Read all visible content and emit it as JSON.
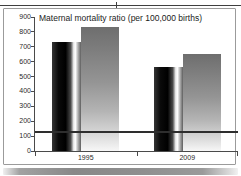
{
  "chart_data": {
    "type": "bar",
    "title": "Maternal mortality ratio (per 100,000 births)",
    "categories": [
      "1995",
      "2009"
    ],
    "series": [
      {
        "name": "dark-glossy-bars",
        "values": [
          730,
          565
        ]
      },
      {
        "name": "gray-gradient-bars",
        "values": [
          830,
          650
        ]
      }
    ],
    "reference_line": {
      "value": 130
    },
    "ylim": [
      0,
      900
    ],
    "ytick_step": 100,
    "yticks": [
      900,
      800,
      700,
      600,
      500,
      400,
      300,
      200,
      100,
      0
    ],
    "grid": false,
    "legend": "none",
    "values_are_estimates": true
  },
  "colors": {
    "bar_dark_base": "#000000",
    "bar_dark_highlight": "#ffffff",
    "bar_gray_top": "#6e6e6e",
    "bar_gray_bottom": "#f7f7f7",
    "reference_line": "#2e2e2e",
    "axis": "#4a4a4a",
    "frame_border": "#9b9b9b",
    "title_text": "#1b1b1b",
    "background": "#ffffff"
  }
}
